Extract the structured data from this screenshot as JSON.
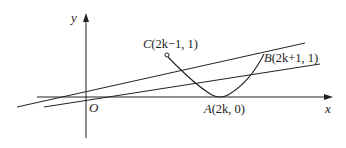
{
  "figure": {
    "axes": {
      "x_label": "x",
      "y_label": "y",
      "origin_label": "O"
    },
    "points": {
      "A": {
        "name": "A",
        "coords": "(2k, 0)",
        "label_prefix": "A",
        "label_rest": "(2k, 0)"
      },
      "B": {
        "name": "B",
        "coords": "(2k+1, 1)",
        "label_prefix": "B",
        "label_rest": "(2k+1, 1)"
      },
      "C": {
        "name": "C",
        "coords": "(2k−1, 1)",
        "label_prefix": "C",
        "label_rest": "(2k−1, 1)",
        "open_endpoint": true
      }
    },
    "curves": [
      {
        "name": "parabola-segment",
        "description": "parabola arc from C through A to B"
      },
      {
        "name": "line-through-origin-to-B",
        "description": "line through O and B"
      },
      {
        "name": "line-through-origin-shallow",
        "description": "line through O with smaller slope"
      }
    ],
    "stroke_color": "#222222"
  }
}
